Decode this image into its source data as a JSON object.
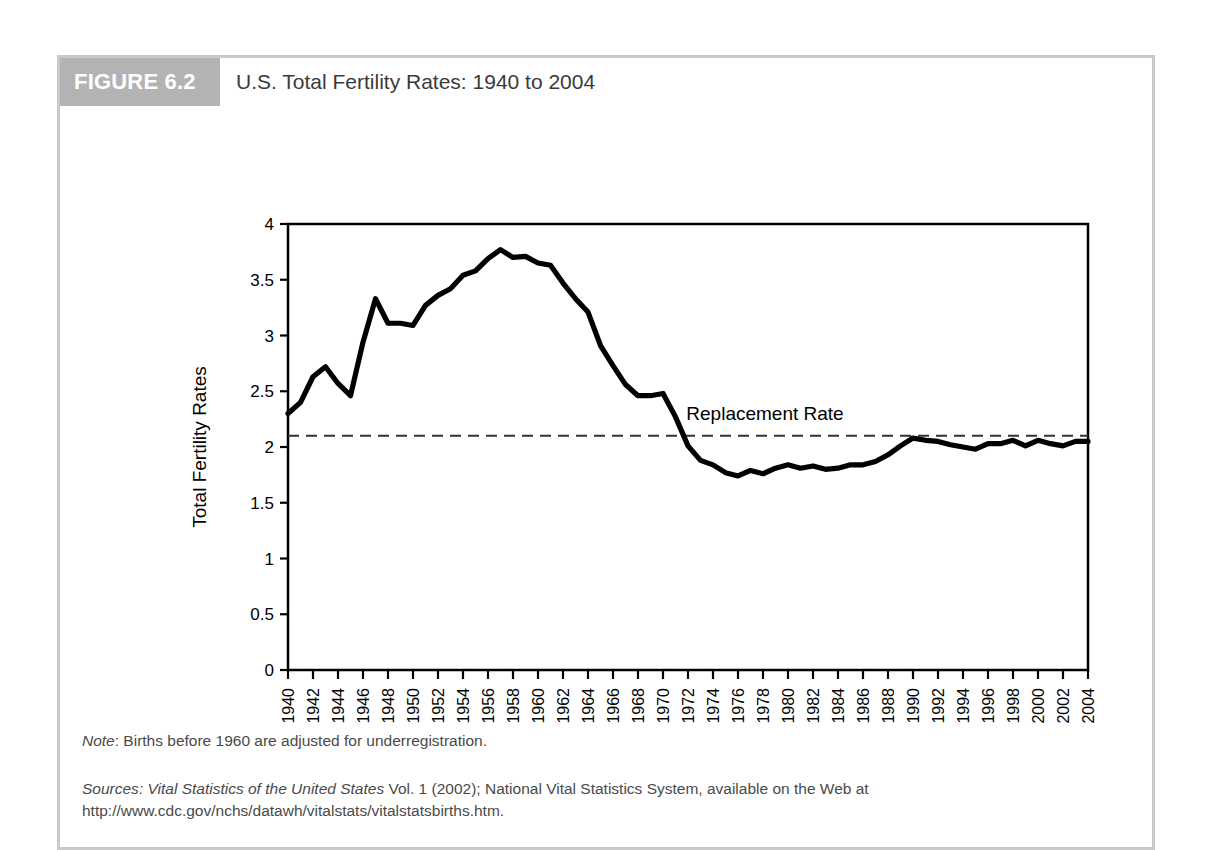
{
  "figure": {
    "badge": "FIGURE 6.2",
    "title": "U.S. Total Fertility Rates: 1940 to 2004",
    "note_prefix": "Note",
    "note_text": ": Births before 1960 are adjusted for underregistration.",
    "sources_prefix": "Sources",
    "sources_italic": ": Vital Statistics of the United States",
    "sources_text": " Vol. 1 (2002); National Vital Statistics System, available on the Web at http://www.cdc.gov/nchs/datawh/vitalstats/vitalstatsbirths.htm.",
    "colors": {
      "frame_border": "#c9c9c9",
      "badge_background": "#b3b3b3",
      "badge_text": "#ffffff",
      "header_background": "#cfcfcf",
      "title_text": "#3a3a3a",
      "line": "#000000",
      "note_text": "#4a4a4a"
    }
  },
  "chart_data": {
    "type": "line",
    "title": "U.S. Total Fertility Rates: 1940 to 2004",
    "xlabel": "Year",
    "ylabel": "Total Fertility Rates",
    "xlim": [
      1940,
      2004
    ],
    "ylim": [
      0,
      4
    ],
    "yticks": [
      0,
      0.5,
      1,
      1.5,
      2,
      2.5,
      3,
      3.5,
      4
    ],
    "ytick_labels": [
      "0",
      "0.5",
      "1",
      "1.5",
      "2",
      "2.5",
      "3",
      "3.5",
      "4"
    ],
    "xticks": [
      1940,
      1942,
      1944,
      1946,
      1948,
      1950,
      1952,
      1954,
      1956,
      1958,
      1960,
      1962,
      1964,
      1966,
      1968,
      1970,
      1972,
      1974,
      1976,
      1978,
      1980,
      1982,
      1984,
      1986,
      1988,
      1990,
      1992,
      1994,
      1996,
      1998,
      2000,
      2002,
      2004
    ],
    "xtick_labels": [
      "1940",
      "1942",
      "1944",
      "1946",
      "1948",
      "1950",
      "1952",
      "1954",
      "1956",
      "1958",
      "1960",
      "1962",
      "1964",
      "1966",
      "1968",
      "1970",
      "1972",
      "1974",
      "1976",
      "1978",
      "1980",
      "1982",
      "1984",
      "1986",
      "1988",
      "1990",
      "1992",
      "1994",
      "1996",
      "1998",
      "2000",
      "2002",
      "2004"
    ],
    "xtick_rotation": -90,
    "grid": false,
    "legend": false,
    "series": [
      {
        "name": "Total Fertility Rate",
        "x": [
          1940,
          1941,
          1942,
          1943,
          1944,
          1945,
          1946,
          1947,
          1948,
          1949,
          1950,
          1951,
          1952,
          1953,
          1954,
          1955,
          1956,
          1957,
          1958,
          1959,
          1960,
          1961,
          1962,
          1963,
          1964,
          1965,
          1966,
          1967,
          1968,
          1969,
          1970,
          1971,
          1972,
          1973,
          1974,
          1975,
          1976,
          1977,
          1978,
          1979,
          1980,
          1981,
          1982,
          1983,
          1984,
          1985,
          1986,
          1987,
          1988,
          1989,
          1990,
          1991,
          1992,
          1993,
          1994,
          1995,
          1996,
          1997,
          1998,
          1999,
          2000,
          2001,
          2002,
          2003,
          2004
        ],
        "y": [
          2.3,
          2.4,
          2.63,
          2.72,
          2.57,
          2.46,
          2.94,
          3.33,
          3.11,
          3.11,
          3.09,
          3.27,
          3.36,
          3.42,
          3.54,
          3.58,
          3.69,
          3.77,
          3.7,
          3.71,
          3.65,
          3.63,
          3.47,
          3.33,
          3.21,
          2.91,
          2.73,
          2.56,
          2.46,
          2.46,
          2.48,
          2.27,
          2.01,
          1.88,
          1.84,
          1.77,
          1.74,
          1.79,
          1.76,
          1.81,
          1.84,
          1.81,
          1.83,
          1.8,
          1.81,
          1.84,
          1.84,
          1.87,
          1.93,
          2.01,
          2.08,
          2.06,
          2.05,
          2.02,
          2.0,
          1.98,
          2.03,
          2.03,
          2.06,
          2.01,
          2.06,
          2.03,
          2.01,
          2.05,
          2.05
        ]
      }
    ],
    "annotations": [
      {
        "name": "replacement-rate",
        "label": "Replacement Rate",
        "value": 2.1,
        "style": "dashed-horizontal-line"
      }
    ]
  }
}
